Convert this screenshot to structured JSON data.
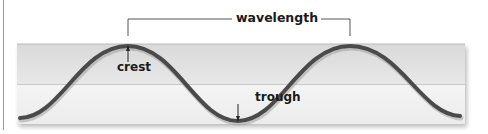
{
  "diagram": {
    "labels": {
      "wavelength": "wavelength",
      "crest": "crest",
      "trough": "trough"
    },
    "colors": {
      "wave": "#4a4a4a",
      "panel_top": "#e2e2e2",
      "panel_bottom": "#f2f2f2",
      "bracket": "#555555",
      "text": "#1a1a1a"
    },
    "parts": [
      {
        "name": "crest",
        "description": "highest point of the wave"
      },
      {
        "name": "trough",
        "description": "lowest point of the wave"
      },
      {
        "name": "wavelength",
        "description": "distance from crest to crest"
      }
    ]
  }
}
